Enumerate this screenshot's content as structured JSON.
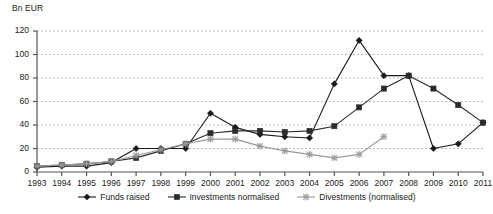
{
  "chart_data": {
    "type": "line",
    "title": "",
    "ylabel": "Bn EUR",
    "xlabel": "",
    "ylim": [
      0,
      120
    ],
    "yticks": [
      0,
      20,
      40,
      60,
      80,
      100,
      120
    ],
    "grid": true,
    "legend_position": "bottom",
    "categories": [
      "1993",
      "1994",
      "1995",
      "1996",
      "1997",
      "1998",
      "1999",
      "2000",
      "2001",
      "2002",
      "2003",
      "2004",
      "2005",
      "2006",
      "2007",
      "2008",
      "2009",
      "2010",
      "2011"
    ],
    "series": [
      {
        "name": "Funds raised",
        "marker": "diamond",
        "color": "#1a1a1a",
        "values": [
          4,
          5,
          5,
          8,
          20,
          20,
          20,
          50,
          38,
          32,
          30,
          29,
          75,
          112,
          82,
          82,
          20,
          24,
          42
        ]
      },
      {
        "name": "Investments normalised",
        "marker": "square",
        "color": "#2b2b2b",
        "values": [
          5,
          6,
          7,
          9,
          12,
          18,
          24,
          33,
          35,
          35,
          34,
          35,
          39,
          55,
          71,
          82,
          71,
          57,
          42
        ]
      },
      {
        "name": "Divestments (normalised)",
        "marker": "cross",
        "color": "#9a9a9a",
        "values": [
          5,
          6,
          7,
          9,
          14,
          19,
          24,
          28,
          28,
          22,
          18,
          15,
          12,
          15,
          30,
          null,
          null,
          null,
          null
        ]
      }
    ]
  },
  "legend": {
    "items": [
      {
        "label": "Funds raised"
      },
      {
        "label": "Investments normalised"
      },
      {
        "label": "Divestments (normalised)"
      }
    ]
  }
}
